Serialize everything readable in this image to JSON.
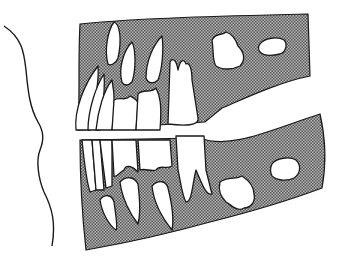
{
  "figure": {
    "colors": {
      "background": "#ffffff",
      "bone_hatch": "#8a8a8a",
      "outline": "#1a1a1a",
      "tooth_fill": "#ffffff"
    },
    "regions": [
      {
        "name": "soft-tissue-profile"
      },
      {
        "name": "maxilla"
      },
      {
        "name": "mandible"
      },
      {
        "name": "upper-erupted-teeth"
      },
      {
        "name": "lower-erupted-teeth"
      },
      {
        "name": "upper-unerupted-teeth"
      },
      {
        "name": "lower-unerupted-teeth"
      },
      {
        "name": "developing-molar-crypts"
      }
    ]
  }
}
